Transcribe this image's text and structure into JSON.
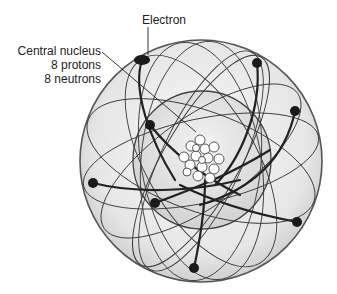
{
  "diagram": {
    "type": "atom-model",
    "labels": {
      "electron": "Electron",
      "nucleus_line1": "Central nucleus",
      "nucleus_line2": "8 protons",
      "nucleus_line3": "8 neutrons"
    },
    "electron_count": 8,
    "nucleon_count": 16,
    "colors": {
      "outline": "#555555",
      "orbit": "#444444",
      "electron": "#1a1a1a",
      "sphere_fill": "#e8e8e8"
    }
  }
}
